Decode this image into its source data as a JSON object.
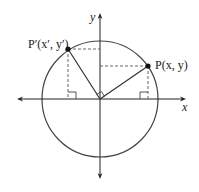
{
  "diagram": {
    "type": "unit-circle-rotation",
    "axis_labels": {
      "x": "x",
      "y": "y"
    },
    "points": [
      {
        "id": "P",
        "label": "P(x, y)"
      },
      {
        "id": "P-prime",
        "label": "P′(x′, y′)"
      }
    ],
    "annotations": [
      "right-angle at origin between OP and OP′",
      "right-angle marks at feet of perpendiculars on x-axis"
    ],
    "colors": {
      "stroke": "#333333",
      "dash": "#555555"
    }
  }
}
